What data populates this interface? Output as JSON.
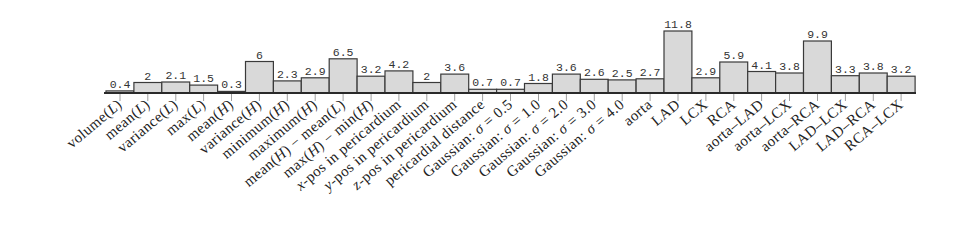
{
  "chart_data": {
    "type": "bar",
    "title": "",
    "xlabel": "",
    "ylabel": "",
    "ylim": [
      0,
      11.8
    ],
    "grid": false,
    "legend": null,
    "categories": [
      "volume(L)",
      "mean(L)",
      "variance(L)",
      "max(L)",
      "mean(H)",
      "variance(H)",
      "minimum(H)",
      "maximum(H)",
      "mean(H) − mean(L)",
      "max(H) − min(H)",
      "x-pos in pericardium",
      "y-pos in pericardium",
      "z-pos in pericardium",
      "pericardial distance",
      "Gaussian: σ = 0.5",
      "Gaussian: σ = 1.0",
      "Gaussian: σ = 2.0",
      "Gaussian: σ = 3.0",
      "Gaussian: σ = 4.0",
      "aorta",
      "LAD",
      "LCX",
      "RCA",
      "aorta–LAD",
      "aorta–LCX",
      "aorta–RCA",
      "LAD–LCX",
      "LAD–RCA",
      "RCA–LCX"
    ],
    "values": [
      0.4,
      2,
      2.1,
      1.5,
      0.3,
      6,
      2.3,
      2.9,
      6.5,
      3.2,
      4.2,
      2,
      3.6,
      0.7,
      0.7,
      1.8,
      3.6,
      2.6,
      2.5,
      2.7,
      11.8,
      2.9,
      5.9,
      4.1,
      3.8,
      9.9,
      3.3,
      3.8,
      3.2
    ],
    "value_labels": [
      "0.4",
      "2",
      "2.1",
      "1.5",
      "0.3",
      "6",
      "2.3",
      "2.9",
      "6.5",
      "3.2",
      "4.2",
      "2",
      "3.6",
      "0.7",
      "0.7",
      "1.8",
      "3.6",
      "2.6",
      "2.5",
      "2.7",
      "11.8",
      "2.9",
      "5.9",
      "4.1",
      "3.8",
      "9.9",
      "3.3",
      "3.8",
      "3.2"
    ],
    "colors": {
      "bar_fill": "#d9d9d9",
      "bar_stroke": "#3a3a3a"
    }
  }
}
